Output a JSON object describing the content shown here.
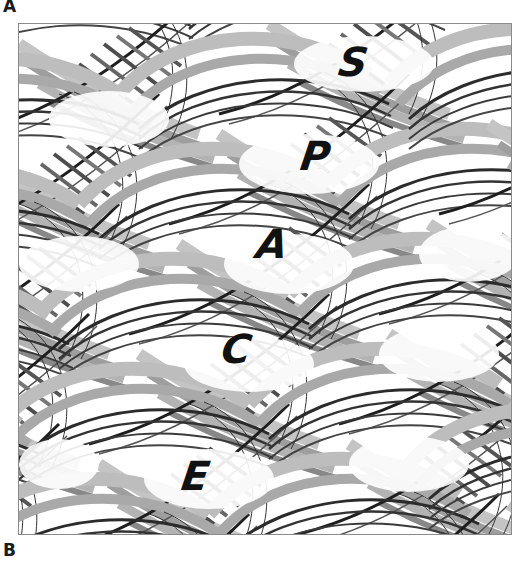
{
  "panels": {
    "top_label": "A",
    "bottom_label": "B"
  },
  "artwork": {
    "letters": [
      {
        "char": "S",
        "x": 320,
        "y": 18
      },
      {
        "char": "P",
        "x": 282,
        "y": 112
      },
      {
        "char": "A",
        "x": 238,
        "y": 200
      },
      {
        "char": "C",
        "x": 203,
        "y": 305
      },
      {
        "char": "E",
        "x": 163,
        "y": 432
      }
    ],
    "colors": {
      "ink": "#111111",
      "dark_stroke": "#2b2b2b",
      "mid_gray": "#8c8c8c",
      "light_gray": "#b9b9b9",
      "background": "#ffffff",
      "frame": "#8a8a8a"
    }
  }
}
